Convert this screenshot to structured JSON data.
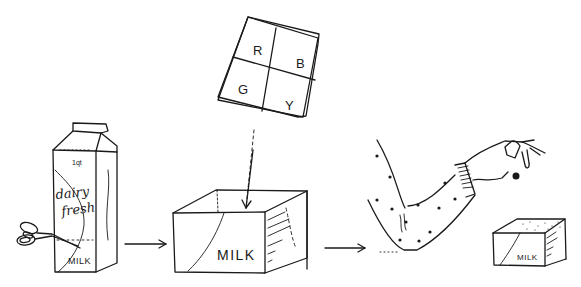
{
  "diagram": {
    "type": "process-illustration",
    "ink_color": "#1a1a1a",
    "background": "#ffffff",
    "steps": [
      {
        "id": "carton",
        "description": "Milk carton being cut with scissors",
        "labels": {
          "size": "1qt",
          "brand_line1": "dairy",
          "brand_line2": "fresh",
          "product": "MILK"
        }
      },
      {
        "id": "cut-box",
        "description": "Bottom of carton cut into open box",
        "labels": {
          "product": "MILK"
        }
      },
      {
        "id": "color-card",
        "description": "Square card with four color letters dropped into box",
        "cells": [
          "R",
          "B",
          "G",
          "Y"
        ]
      },
      {
        "id": "hand-drop",
        "description": "Arm in polka-dot sleeve dropping a small ball into small box",
        "labels": {
          "product": "MILK"
        }
      }
    ],
    "arrows": [
      {
        "from": "carton",
        "to": "cut-box"
      },
      {
        "from": "color-card",
        "to": "cut-box"
      },
      {
        "from": "cut-box",
        "to": "hand-drop"
      }
    ]
  }
}
